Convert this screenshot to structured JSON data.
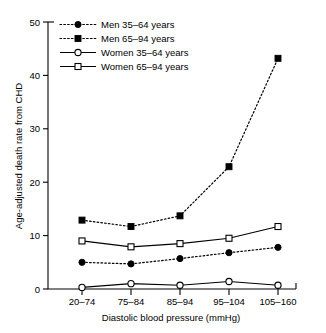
{
  "chart_data": {
    "type": "line",
    "title": "",
    "xlabel": "Diastolic blood pressure (mmHg)",
    "ylabel": "Age-adjusted death rate from CHD",
    "categories": [
      "20–74",
      "75–84",
      "85–94",
      "95–104",
      "105–160"
    ],
    "ylim": [
      0,
      50
    ],
    "yticks": [
      0,
      10,
      20,
      30,
      40,
      50
    ],
    "ytick_labels": [
      "0",
      "10",
      "20",
      "30",
      "40",
      "50"
    ],
    "grid": false,
    "legend_position": "top-left",
    "series": [
      {
        "name": "Men 35–64 years",
        "values": [
          5.0,
          4.7,
          5.7,
          6.8,
          7.8
        ],
        "marker": "filled-circle",
        "line_style": "dotted",
        "color": "#000000"
      },
      {
        "name": "Men 65–94 years",
        "values": [
          12.9,
          11.7,
          13.7,
          22.9,
          43.2
        ],
        "marker": "filled-square",
        "line_style": "dotted",
        "color": "#000000"
      },
      {
        "name": "Women 35–64 years",
        "values": [
          0.3,
          1.0,
          0.7,
          1.4,
          0.7
        ],
        "marker": "open-circle",
        "line_style": "solid",
        "color": "#000000"
      },
      {
        "name": "Women 65–94 years",
        "values": [
          9.0,
          7.9,
          8.5,
          9.5,
          11.7
        ],
        "marker": "open-square",
        "line_style": "solid",
        "color": "#000000"
      }
    ]
  },
  "legend": {
    "entries": [
      {
        "label": "Men 35–64 years"
      },
      {
        "label": "Men 65–94 years"
      },
      {
        "label": "Women 35–64 years"
      },
      {
        "label": "Women 65–94 years"
      }
    ]
  },
  "axes": {
    "y_title": "Age-adjusted death rate from CHD",
    "x_title": "Diastolic blood pressure (mmHg)",
    "y_tick_0": "0",
    "y_tick_1": "10",
    "y_tick_2": "20",
    "y_tick_3": "30",
    "y_tick_4": "40",
    "y_tick_5": "50",
    "x_tick_0": "20–74",
    "x_tick_1": "75–84",
    "x_tick_2": "85–94",
    "x_tick_3": "95–104",
    "x_tick_4": "105–160"
  }
}
